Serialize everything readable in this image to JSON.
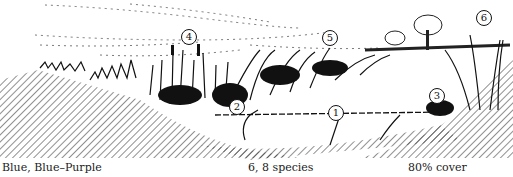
{
  "figure": {
    "markers": [
      {
        "id": 1,
        "label": "1",
        "x": 335,
        "y": 112
      },
      {
        "id": 2,
        "label": "2",
        "x": 236,
        "y": 106
      },
      {
        "id": 3,
        "label": "3",
        "x": 436,
        "y": 95
      },
      {
        "id": 4,
        "label": "4",
        "x": 188,
        "y": 36
      },
      {
        "id": 5,
        "label": "5",
        "x": 329,
        "y": 37
      },
      {
        "id": 6,
        "label": "6",
        "x": 483,
        "y": 17
      }
    ],
    "ink_color": "#111111",
    "background_color": "#ffffff"
  },
  "captions": {
    "left": "Blue, Blue–Purple",
    "center": "6, 8 species",
    "right": "80% cover"
  }
}
